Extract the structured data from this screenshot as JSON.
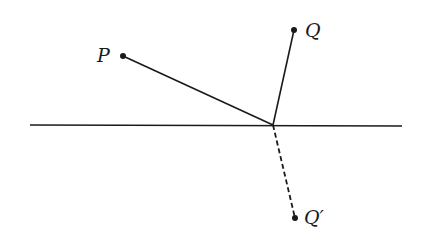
{
  "diagram": {
    "type": "reflection-geometry",
    "colors": {
      "ink": "#1a1a1a",
      "background": "#ffffff"
    },
    "mirror_line": {
      "x1": 30,
      "y1": 125,
      "x2": 402,
      "y2": 126
    },
    "reflection_point": {
      "x": 273,
      "y": 125
    },
    "points": [
      {
        "id": "P",
        "label": "P",
        "x": 123,
        "y": 56,
        "label_x": 97,
        "label_y": 62
      },
      {
        "id": "Q",
        "label": "Q",
        "x": 294,
        "y": 30,
        "label_x": 305,
        "label_y": 37
      },
      {
        "id": "Qprime",
        "label": "Q′",
        "x": 295,
        "y": 218,
        "label_x": 304,
        "label_y": 224
      }
    ],
    "segments": [
      {
        "from": "P",
        "to": "reflection_point",
        "style": "solid"
      },
      {
        "from": "Q",
        "to": "reflection_point",
        "style": "solid"
      },
      {
        "from": "reflection_point",
        "to": "Qprime",
        "style": "dashed"
      }
    ]
  }
}
